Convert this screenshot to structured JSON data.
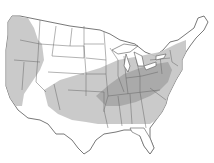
{
  "map": {
    "title": "",
    "subject": "Range map of contiguous United States with shaded distribution regions",
    "colors": {
      "background": "#ffffff",
      "land": "#ffffff",
      "border": "#555555",
      "range_light": "#c4c4c4",
      "range_dark": "#a8a8a8"
    },
    "regions": [
      {
        "name": "west-coast-range",
        "shade": "light"
      },
      {
        "name": "central-eastern-range",
        "shade": "light"
      },
      {
        "name": "core-midwest-range",
        "shade": "dark"
      }
    ]
  }
}
